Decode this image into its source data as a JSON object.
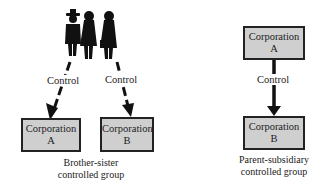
{
  "left_group": {
    "control_label_a": "Control",
    "control_label_b": "Control",
    "corp_a": {
      "line1": "Corporation",
      "line2": "A"
    },
    "corp_b": {
      "line1": "Corporation",
      "line2": "B"
    },
    "caption_line1": "Brother-sister",
    "caption_line2": "controlled group",
    "icon": "people-silhouette-icon"
  },
  "right_group": {
    "corp_a": {
      "line1": "Corporation",
      "line2": "A"
    },
    "control_label": "Control",
    "corp_b": {
      "line1": "Corporation",
      "line2": "B"
    },
    "caption_line1": "Parent-subsidiary",
    "caption_line2": "controlled group"
  }
}
